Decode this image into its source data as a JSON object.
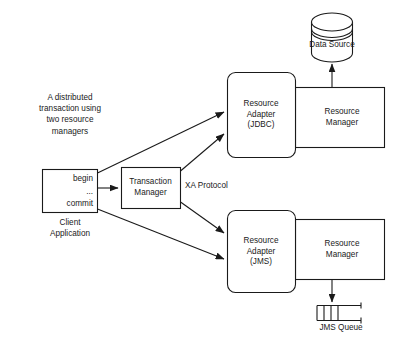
{
  "diagram": {
    "title": "A distributed transaction using two resource managers",
    "caption": {
      "text": "A distributed transaction using\ntwo resource\nmanagers",
      "line1": "A distributed",
      "line2": "transaction using",
      "line3": "two resource",
      "line4": "managers",
      "full": "A distributed\ntransaction using\ntwo resource\nmanagers"
    },
    "stroke_color": "#1a1a1a",
    "fill_color": "#ffffff",
    "nodes": {
      "client_application": {
        "inner_text": "begin\n...\ncommit",
        "inner_line1": "begin",
        "inner_line2": "...",
        "inner_line3": "commit",
        "caption": "Client\nApplication",
        "shape": "rectangle"
      },
      "transaction_manager": {
        "label": "Transaction\nManager",
        "shape": "rectangle"
      },
      "resource_adapter_jdbc": {
        "label": "Resource\nAdapter\n(JDBC)",
        "shape": "rounded-rectangle"
      },
      "resource_adapter_jms": {
        "label": "Resource\nAdapter\n(JMS)",
        "shape": "rounded-rectangle"
      },
      "resource_manager_top": {
        "label": "Resource\nManager",
        "shape": "rectangle"
      },
      "resource_manager_bottom": {
        "label": "Resource\nManager",
        "shape": "rectangle"
      },
      "data_source": {
        "label": "Data Source",
        "shape": "cylinder"
      },
      "jms_queue": {
        "caption": "JMS Queue",
        "shape": "open-queue",
        "cells": 4
      }
    },
    "edges": {
      "xa_protocol_label": "XA Protocol",
      "client_to_jdbc_adapter": "",
      "client_to_transaction_manager": "",
      "client_to_jms_adapter": "",
      "tm_to_jdbc_adapter": "",
      "tm_to_jms_adapter": "",
      "rm_top_to_data_source": "",
      "rm_bottom_to_jms_queue": ""
    }
  }
}
